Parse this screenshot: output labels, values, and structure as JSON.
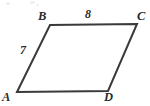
{
  "figure": {
    "background_color": "#ffffff",
    "stroke_color": "#3a3a3a",
    "stroke_width": 2,
    "text_color": "#2b2b2b",
    "vertices": {
      "A": {
        "label": "A",
        "x": 17,
        "y": 92
      },
      "B": {
        "label": "B",
        "x": 50,
        "y": 25
      },
      "C": {
        "label": "C",
        "x": 137,
        "y": 24
      },
      "D": {
        "label": "D",
        "x": 108,
        "y": 91
      }
    },
    "sides": [
      {
        "name": "AB",
        "from": "A",
        "to": "B",
        "measure": "7"
      },
      {
        "name": "BC",
        "from": "B",
        "to": "C",
        "measure": "8"
      },
      {
        "name": "CD",
        "from": "C",
        "to": "D",
        "measure": ""
      },
      {
        "name": "DA",
        "from": "D",
        "to": "A",
        "measure": ""
      }
    ],
    "measures": {
      "side_ab": "7",
      "side_bc": "8"
    }
  },
  "chart_data": {
    "type": "diagram",
    "shape": "parallelogram",
    "vertex_labels": [
      "A",
      "B",
      "C",
      "D"
    ],
    "vertex_points": [
      [
        17,
        92
      ],
      [
        50,
        25
      ],
      [
        137,
        24
      ],
      [
        108,
        91
      ]
    ],
    "edge_labels": [
      {
        "edge": "BC",
        "value": "8"
      },
      {
        "edge": "AB",
        "value": "7"
      }
    ],
    "annotations": [
      "8",
      "7"
    ]
  }
}
